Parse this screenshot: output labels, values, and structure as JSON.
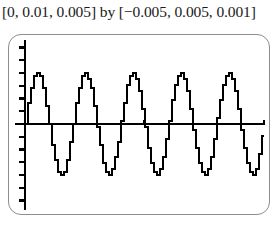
{
  "caption": {
    "text": "[0, 0.01, 0.005] by [−0.005, 0.005, 0.001]"
  },
  "calculator_screen": {
    "label": "graphing-calculator-viewport",
    "frame_color": "#8d8d8d",
    "trace_color": "#000000",
    "background_color": "#ffffff"
  },
  "chart_data": {
    "type": "line",
    "title": "",
    "subtitle": "",
    "xlabel": "",
    "ylabel": "",
    "xlim": [
      0,
      0.01
    ],
    "ylim": [
      -0.005,
      0.005
    ],
    "x_tick_step": 0.005,
    "y_tick_step": 0.001,
    "grid": false,
    "legend": null,
    "axis_style": "tick-marks-on-axes",
    "y_axis_position_x": 0.0,
    "x_axis_position_y": 0.0,
    "series": [
      {
        "name": "sine-trace",
        "amplitude": 0.004,
        "period": 0.002,
        "phase": 0,
        "frequency_cycles_over_window": 5,
        "x": [
          0,
          0.0005,
          0.001,
          0.0015,
          0.002,
          0.0025,
          0.003,
          0.0035,
          0.004,
          0.0045,
          0.005,
          0.0055,
          0.006,
          0.0065,
          0.007,
          0.0075,
          0.008,
          0.0085,
          0.009,
          0.0095,
          0.01
        ],
        "values": [
          0,
          0.004,
          0,
          -0.004,
          0,
          0.004,
          0,
          -0.004,
          0,
          0.004,
          0,
          -0.004,
          0,
          0.004,
          0,
          -0.004,
          0,
          0.004,
          0,
          -0.004,
          0
        ]
      }
    ],
    "y_ticks": [
      -0.004,
      -0.003,
      -0.002,
      -0.001,
      0.001,
      0.002,
      0.003,
      0.004
    ],
    "x_ticks": [
      0.005,
      0.01
    ]
  }
}
